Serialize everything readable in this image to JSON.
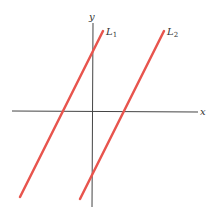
{
  "axes": {
    "x_label": "x",
    "y_label": "y",
    "axis_color": "#333333"
  },
  "lines": [
    {
      "name": "L",
      "subscript": "1",
      "color": "#e8554e"
    },
    {
      "name": "L",
      "subscript": "2",
      "color": "#e8554e"
    }
  ]
}
